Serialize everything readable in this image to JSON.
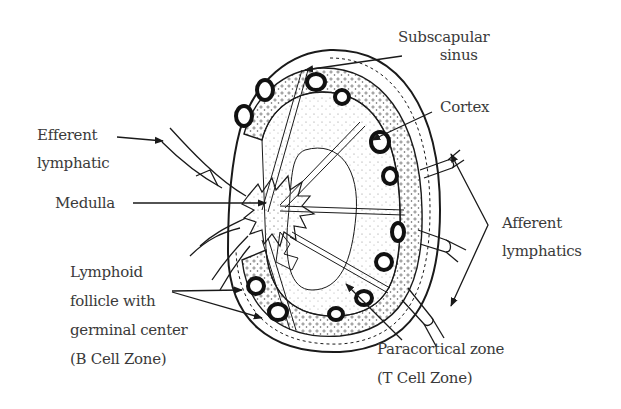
{
  "diagram": {
    "colors": {
      "ink": "#1a1a1a",
      "text": "#3a3a3a",
      "background": "#ffffff",
      "stipple": "#9a9a9a"
    },
    "labels": {
      "subscapular_sinus": {
        "line1": "Subscapular",
        "line2": "sinus"
      },
      "cortex": {
        "line1": "Cortex"
      },
      "efferent_lymphatic": {
        "line1": "Efferent",
        "line2": "lymphatic"
      },
      "medulla": {
        "line1": "Medulla"
      },
      "afferent_lymphatics": {
        "line1": "Afferent",
        "line2": "lymphatics"
      },
      "lymphoid_follicle": {
        "line1": "Lymphoid",
        "line2": "follicle with",
        "line3": "germinal center",
        "line4": "(B Cell Zone)"
      },
      "paracortical_zone": {
        "line1": "Paracortical zone",
        "line2": "(T Cell Zone)"
      }
    }
  }
}
